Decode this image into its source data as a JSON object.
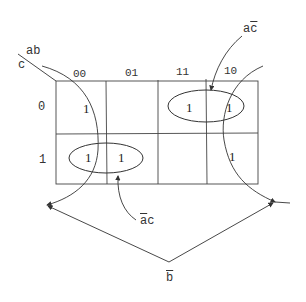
{
  "kmap": {
    "row_var": "c",
    "col_vars": "ab",
    "col_headers": [
      "00",
      "01",
      "11",
      "10"
    ],
    "row_headers": [
      "0",
      "1"
    ],
    "cells": [
      [
        "1",
        "",
        "1",
        "1"
      ],
      [
        "1",
        "1",
        "",
        "1"
      ]
    ]
  },
  "groups": {
    "a_cbar": {
      "label_main": "a",
      "label_bar": "c",
      "text": "ac̄"
    },
    "abar_c": {
      "label_bar": "a",
      "label_main": "c",
      "text": "āc"
    },
    "bbar": {
      "label_bar": "b",
      "text": "b̄"
    }
  },
  "colors": {
    "line": "#333333",
    "background": "#ffffff"
  }
}
